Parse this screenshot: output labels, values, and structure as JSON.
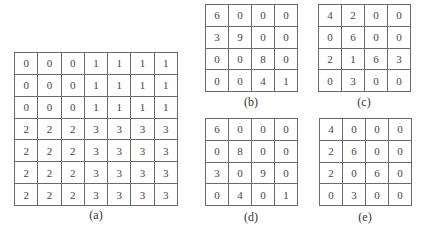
{
  "figure": {
    "panels": [
      {
        "id": "a",
        "label": "(a)",
        "rows": [
          [
            "0",
            "0",
            "0",
            "1",
            "1",
            "1",
            "1"
          ],
          [
            "0",
            "0",
            "0",
            "1",
            "1",
            "1",
            "1"
          ],
          [
            "0",
            "0",
            "0",
            "1",
            "1",
            "1",
            "1"
          ],
          [
            "2",
            "2",
            "2",
            "3",
            "3",
            "3",
            "3"
          ],
          [
            "2",
            "2",
            "2",
            "3",
            "3",
            "3",
            "3"
          ],
          [
            "2",
            "2",
            "2",
            "3",
            "3",
            "3",
            "3"
          ],
          [
            "2",
            "2",
            "2",
            "3",
            "3",
            "3",
            "3"
          ]
        ]
      },
      {
        "id": "b",
        "label": "(b)",
        "rows": [
          [
            "6",
            "0",
            "0",
            "0"
          ],
          [
            "3",
            "9",
            "0",
            "0"
          ],
          [
            "0",
            "0",
            "8",
            "0"
          ],
          [
            "0",
            "0",
            "4",
            "1"
          ]
        ]
      },
      {
        "id": "c",
        "label": "(c)",
        "rows": [
          [
            "4",
            "2",
            "0",
            "0"
          ],
          [
            "0",
            "6",
            "0",
            "0"
          ],
          [
            "2",
            "1",
            "6",
            "3"
          ],
          [
            "0",
            "3",
            "0",
            "0"
          ]
        ]
      },
      {
        "id": "d",
        "label": "(d)",
        "rows": [
          [
            "6",
            "0",
            "0",
            "0"
          ],
          [
            "0",
            "8",
            "0",
            "0"
          ],
          [
            "3",
            "0",
            "9",
            "0"
          ],
          [
            "0",
            "4",
            "0",
            "1"
          ]
        ]
      },
      {
        "id": "e",
        "label": "(e)",
        "rows": [
          [
            "4",
            "0",
            "0",
            "0"
          ],
          [
            "2",
            "6",
            "0",
            "0"
          ],
          [
            "2",
            "0",
            "6",
            "0"
          ],
          [
            "0",
            "3",
            "0",
            "0"
          ]
        ]
      }
    ]
  }
}
